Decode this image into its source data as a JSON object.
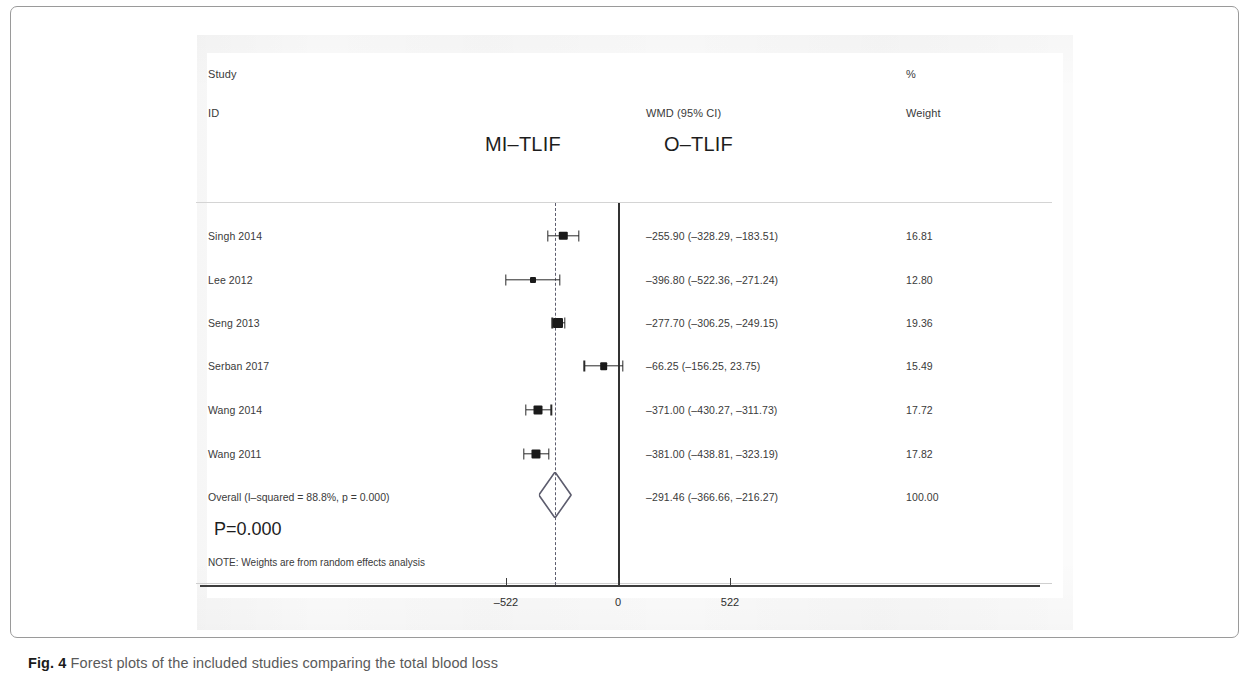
{
  "figure": {
    "caption_bold": "Fig. 4",
    "caption_text": "Forest plots of the included studies comparing the total blood loss"
  },
  "header": {
    "col_study": "Study",
    "col_id": "ID",
    "col_percent": "%",
    "col_weight": "Weight",
    "col_effect": "WMD (95% CI)",
    "group_left": "MI–TLIF",
    "group_right": "O–TLIF"
  },
  "overall": {
    "label": "Overall  (I–squared = 88.8%, p = 0.000)",
    "pvalue": "P=0.000",
    "note": "NOTE: Weights are from random effects analysis"
  },
  "chart_data": {
    "type": "forest",
    "title": "Forest plots of the included studies comparing the total blood loss",
    "xlabel": "",
    "ylabel": "",
    "effect_measure": "WMD (95% CI)",
    "null_value": 0,
    "pooled_line_value": -291.46,
    "axis_ticks": [
      "–522",
      "0",
      "522"
    ],
    "axis_tick_values": [
      -522,
      0,
      522
    ],
    "xlim": [
      -1000,
      1000
    ],
    "grid": false,
    "legend": "none",
    "heterogeneity": {
      "i_squared": "88.8%",
      "p": "0.000",
      "model": "random effects"
    },
    "studies": [
      {
        "id": "Singh 2014",
        "effect": -255.9,
        "ci_low": -328.29,
        "ci_high": -183.51,
        "weight": 16.81,
        "effect_text": "–255.90 (–328.29, –183.51)",
        "weight_text": "16.81"
      },
      {
        "id": "Lee 2012",
        "effect": -396.8,
        "ci_low": -522.36,
        "ci_high": -271.24,
        "weight": 12.8,
        "effect_text": "–396.80 (–522.36, –271.24)",
        "weight_text": "12.80"
      },
      {
        "id": "Seng 2013",
        "effect": -277.7,
        "ci_low": -306.25,
        "ci_high": -249.15,
        "weight": 19.36,
        "effect_text": "–277.70 (–306.25, –249.15)",
        "weight_text": "19.36"
      },
      {
        "id": "Serban 2017",
        "effect": -66.25,
        "ci_low": -156.25,
        "ci_high": 23.75,
        "weight": 15.49,
        "effect_text": "–66.25 (–156.25, 23.75)",
        "weight_text": "15.49"
      },
      {
        "id": "Wang 2014",
        "effect": -371.0,
        "ci_low": -430.27,
        "ci_high": -311.73,
        "weight": 17.72,
        "effect_text": "–371.00 (–430.27, –311.73)",
        "weight_text": "17.72"
      },
      {
        "id": "Wang 2011",
        "effect": -381.0,
        "ci_low": -438.81,
        "ci_high": -323.19,
        "weight": 17.82,
        "effect_text": "–381.00 (–438.81, –323.19)",
        "weight_text": "17.82"
      }
    ],
    "summary": {
      "id": "Overall  (I–squared = 88.8%, p = 0.000)",
      "effect": -291.46,
      "ci_low": -366.66,
      "ci_high": -216.27,
      "weight": 100.0,
      "effect_text": "–291.46 (–366.66, –216.27)",
      "weight_text": "100.00"
    }
  },
  "colors": {
    "marker": "#1a1a1a",
    "null_line": "#323232",
    "pooled_line": "#5d5d6e",
    "diamond_stroke": "#5d5d6e",
    "frame": "#9a9a9a"
  }
}
